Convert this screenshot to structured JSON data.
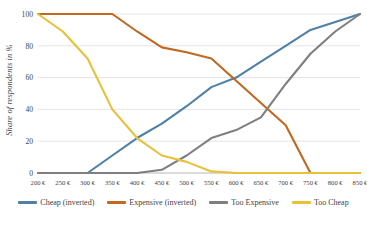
{
  "chart_data": {
    "type": "line",
    "title": "",
    "subtitle": "",
    "xlabel": "",
    "ylabel": "Share of respondents in %",
    "grid": true,
    "legend_position": "bottom",
    "x": [
      "200 €",
      "250 €",
      "300 €",
      "350 €",
      "400 €",
      "450 €",
      "500 €",
      "550 €",
      "600 €",
      "650 €",
      "700 €",
      "750 €",
      "800 €",
      "850 €"
    ],
    "x_values": [
      200,
      250,
      300,
      350,
      400,
      450,
      500,
      550,
      600,
      650,
      700,
      750,
      800,
      850
    ],
    "ylim": [
      0,
      100
    ],
    "xlim": [
      200,
      850
    ],
    "yticks": [
      0,
      20,
      40,
      60,
      80,
      100
    ],
    "ytick_labels": [
      "0",
      "20",
      "40",
      "60",
      "80",
      "100"
    ],
    "series": [
      {
        "name": "Cheap (inverted)",
        "color": "#4f81a8",
        "values": [
          0,
          0,
          0,
          11,
          22,
          31,
          42,
          54,
          60,
          70,
          80,
          90,
          95,
          100
        ]
      },
      {
        "name": "Expensive (inverted)",
        "color": "#c0691f",
        "values": [
          100,
          100,
          100,
          100,
          89,
          79,
          76,
          72,
          58,
          44,
          30,
          0,
          0,
          0
        ]
      },
      {
        "name": "Too Expensive",
        "color": "#7f7f7f",
        "values": [
          0,
          0,
          0,
          0,
          0,
          2,
          11,
          22,
          27,
          35,
          56,
          75,
          89,
          100
        ]
      },
      {
        "name": "Too Cheap",
        "color": "#e8c139",
        "values": [
          100,
          89,
          72,
          40,
          22,
          11,
          7,
          1,
          0,
          0,
          0,
          0,
          0,
          0
        ]
      }
    ]
  },
  "legend": {
    "items": [
      {
        "label": "Cheap (inverted)",
        "color": "#4f81a8"
      },
      {
        "label": "Expensive (inverted)",
        "color": "#c0691f"
      },
      {
        "label": "Too Expensive",
        "color": "#7f7f7f"
      },
      {
        "label": "Too Cheap",
        "color": "#e8c139"
      }
    ]
  }
}
